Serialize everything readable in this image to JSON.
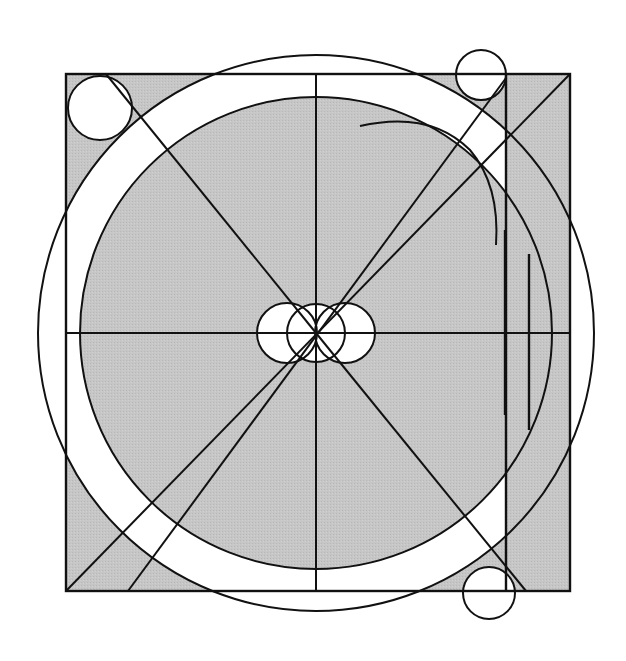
{
  "diagram": {
    "colors": {
      "background": "#ffffff",
      "shade": "#c4c4c4",
      "stroke": "#111111"
    },
    "center": [
      316,
      333
    ],
    "square": {
      "x": 66,
      "y": 74,
      "width": 504,
      "height": 517
    },
    "inner_vertical_line_x": 506,
    "outer_circle_r": 278,
    "inner_circle_r": 236,
    "small_corner_circles": [
      {
        "name": "top-left",
        "cx": 100,
        "cy": 108,
        "r": 32
      },
      {
        "name": "top-right",
        "cx": 481,
        "cy": 75,
        "r": 25
      },
      {
        "name": "bottom-right",
        "cx": 489,
        "cy": 593,
        "r": 26
      }
    ],
    "center_circles": [
      {
        "cx": 287,
        "cy": 333,
        "r": 30
      },
      {
        "cx": 316,
        "cy": 333,
        "r": 29
      },
      {
        "cx": 345,
        "cy": 333,
        "r": 30
      }
    ],
    "labels": []
  }
}
